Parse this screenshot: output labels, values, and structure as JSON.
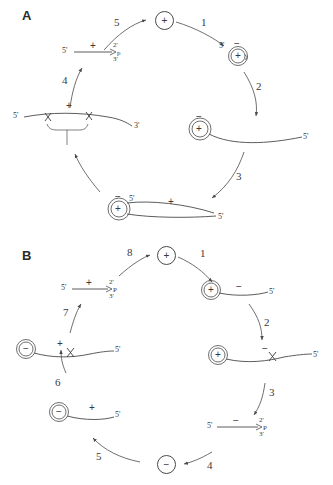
{
  "figure": {
    "panels": [
      {
        "letter": "A",
        "center_node": {
          "label": "+",
          "icon": "circled-plus"
        },
        "steps": [
          {
            "number": "1"
          },
          {
            "number": "2"
          },
          {
            "number": "3"
          },
          {
            "number": "4"
          },
          {
            "number": "5"
          }
        ],
        "species": [
          {
            "id": "a-circ-plus-minus",
            "icon": "double-circle-rna",
            "inner_sign": "+",
            "outer_sign": "−",
            "end_labels": [
              "5'"
            ]
          },
          {
            "id": "a-circ-with-tail",
            "icon": "double-circle-rna-with-tail",
            "inner_sign": "+",
            "outer_sign": "−",
            "end_labels": [
              "5'"
            ]
          },
          {
            "id": "a-circ-two-tails",
            "icon": "double-circle-rna-two-tails",
            "inner_sign": "+",
            "outer_sign": "−",
            "strand_sign": "+",
            "end_labels": [
              "5'",
              "5'"
            ]
          },
          {
            "id": "a-linear-duplex",
            "icon": "linear-strand-two-cleavages",
            "strand_sign": "+",
            "end_labels": [
              "5'",
              "3'"
            ],
            "cleavage_marks": 2,
            "brace": true
          },
          {
            "id": "a-short-linear",
            "icon": "linear-strand-cyclic-phosphate",
            "strand_sign": "+",
            "end_labels": [
              "5'"
            ],
            "cyclic_phosphate": {
              "top": "2'",
              "bottom": "3'",
              "p": "p"
            }
          }
        ]
      },
      {
        "letter": "B",
        "top_node": {
          "label": "+",
          "icon": "circled-plus"
        },
        "bottom_node": {
          "label": "−",
          "icon": "circled-minus"
        },
        "steps": [
          {
            "number": "1"
          },
          {
            "number": "2"
          },
          {
            "number": "3"
          },
          {
            "number": "4"
          },
          {
            "number": "5"
          },
          {
            "number": "6"
          },
          {
            "number": "7"
          },
          {
            "number": "8"
          }
        ],
        "species": [
          {
            "id": "b-plus-circle-minus-tail",
            "icon": "double-circle-rna-with-tail",
            "inner_sign": "+",
            "strand_sign": "−",
            "end_labels": [
              "5'"
            ]
          },
          {
            "id": "b-plus-circle-minus-tail-cleaved",
            "icon": "double-circle-rna-with-tail-cleavage",
            "inner_sign": "+",
            "strand_sign": "−",
            "end_labels": [
              "5'"
            ],
            "cleavage_marks": 1
          },
          {
            "id": "b-minus-linear",
            "icon": "linear-strand-cyclic-phosphate",
            "strand_sign": "−",
            "end_labels": [
              "5'"
            ],
            "cyclic_phosphate": {
              "top": "2'",
              "bottom": "3'",
              "p": "P"
            }
          },
          {
            "id": "b-minus-circle-plus-tail",
            "icon": "double-circle-rna-with-tail",
            "inner_sign": "−",
            "strand_sign": "+",
            "end_labels": [
              "5'"
            ]
          },
          {
            "id": "b-minus-circle-plus-tail-cleaved",
            "icon": "double-circle-rna-with-tail-cleavage",
            "inner_sign": "−",
            "strand_sign": "+",
            "end_labels": [
              "5'"
            ],
            "cleavage_marks": 1
          },
          {
            "id": "b-plus-linear",
            "icon": "linear-strand-cyclic-phosphate",
            "strand_sign": "+",
            "end_labels": [
              "5'"
            ],
            "cyclic_phosphate": {
              "top": "2'",
              "bottom": "3'",
              "p": "P"
            }
          }
        ]
      }
    ],
    "colors": {
      "ink": "#4a4a4a",
      "text": "#3a3a3a",
      "background": "#ffffff"
    }
  }
}
